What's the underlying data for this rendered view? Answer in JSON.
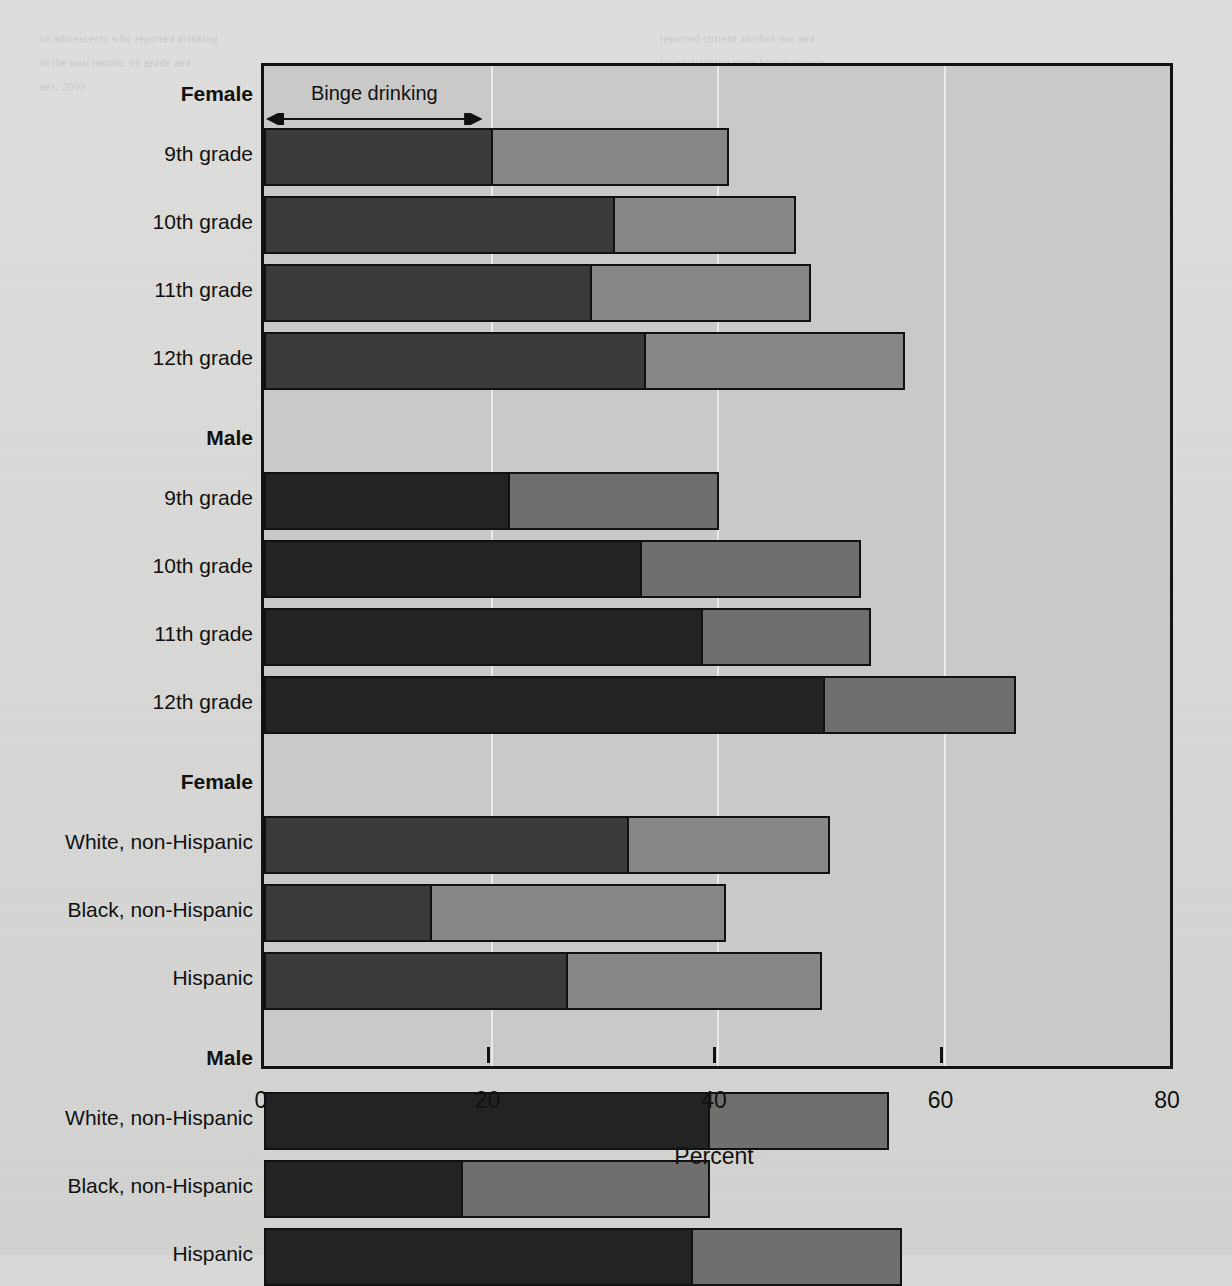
{
  "figure": {
    "annotation_label": "Binge drinking",
    "xaxis": {
      "title": "Percent",
      "ticks": [
        "0",
        "20",
        "40",
        "60",
        "80"
      ]
    }
  },
  "labels": {
    "group_female": "Female",
    "group_male": "Male",
    "grade9": "9th grade",
    "grade10": "10th grade",
    "grade11": "11th grade",
    "grade12": "12th grade",
    "white": "White, non-Hispanic",
    "black": "Black, non-Hispanic",
    "hispanic": "Hispanic"
  },
  "colors": {
    "binge_female": "#3b3b3b",
    "current_female": "#878785",
    "binge_male": "#232323",
    "current_male": "#6f6f6d",
    "frame": "#121212",
    "plot_background": "#c9c9c7",
    "page_background": "#d8d8d6",
    "gridline": "#ffffff"
  },
  "ghost_text": [
    {
      "x": 40,
      "y": 32,
      "text": "of adolescents who reported drinking"
    },
    {
      "x": 40,
      "y": 56,
      "text": "in the past month, by grade and"
    },
    {
      "x": 40,
      "y": 80,
      "text": "sex, 2003"
    },
    {
      "x": 660,
      "y": 32,
      "text": "reported current alcohol use and"
    },
    {
      "x": 660,
      "y": 56,
      "text": "binge drinking were higher among"
    },
    {
      "x": 660,
      "y": 80,
      "text": "male students than female students"
    },
    {
      "x": 660,
      "y": 104,
      "text": "in each grade surveyed."
    },
    {
      "x": 660,
      "y": 140,
      "text": "Among female students, the"
    },
    {
      "x": 660,
      "y": 164,
      "text": "prevalence of current alcohol use"
    },
    {
      "x": 660,
      "y": 188,
      "text": "was similar for White, non-Hispanic"
    },
    {
      "x": 660,
      "y": 212,
      "text": "and Hispanic students, and lower"
    },
    {
      "x": 660,
      "y": 236,
      "text": "for Black, non-Hispanic students."
    },
    {
      "x": 660,
      "y": 272,
      "text": "Binge drinking increased with"
    },
    {
      "x": 660,
      "y": 296,
      "text": "grade level for both sexes."
    }
  ],
  "chart_data": {
    "type": "bar",
    "subtype": "stacked-horizontal",
    "title": "",
    "xlabel": "Percent",
    "ylabel": "",
    "xlim": [
      0,
      80
    ],
    "xticks": [
      0,
      20,
      40,
      60,
      80
    ],
    "grid": "vertical",
    "legend": "inline-annotation",
    "series": [
      {
        "name": "Binge drinking",
        "stack_order": 0
      },
      {
        "name": "Current alcohol use (remainder)",
        "stack_order": 1
      }
    ],
    "groups": [
      {
        "group": "Female",
        "sex": "female",
        "rows": [
          {
            "category": "9th grade",
            "binge": 20.2,
            "total": 41.1
          },
          {
            "category": "10th grade",
            "binge": 31.0,
            "total": 47.0
          },
          {
            "category": "11th grade",
            "binge": 29.0,
            "total": 48.3
          },
          {
            "category": "12th grade",
            "binge": 33.7,
            "total": 56.6
          }
        ]
      },
      {
        "group": "Male",
        "sex": "male",
        "rows": [
          {
            "category": "9th grade",
            "binge": 21.7,
            "total": 40.2
          },
          {
            "category": "10th grade",
            "binge": 33.4,
            "total": 52.7
          },
          {
            "category": "11th grade",
            "binge": 38.8,
            "total": 53.6
          },
          {
            "category": "12th grade",
            "binge": 49.5,
            "total": 66.4
          }
        ]
      },
      {
        "group": "Female",
        "sex": "female",
        "rows": [
          {
            "category": "White, non-Hispanic",
            "binge": 32.2,
            "total": 50.0
          },
          {
            "category": "Black, non-Hispanic",
            "binge": 14.8,
            "total": 40.8
          },
          {
            "category": "Hispanic",
            "binge": 26.8,
            "total": 49.3
          }
        ]
      },
      {
        "group": "Male",
        "sex": "male",
        "rows": [
          {
            "category": "White, non-Hispanic",
            "binge": 39.4,
            "total": 55.2
          },
          {
            "category": "Black, non-Hispanic",
            "binge": 17.6,
            "total": 39.4
          },
          {
            "category": "Hispanic",
            "binge": 37.9,
            "total": 56.3
          }
        ]
      }
    ]
  }
}
